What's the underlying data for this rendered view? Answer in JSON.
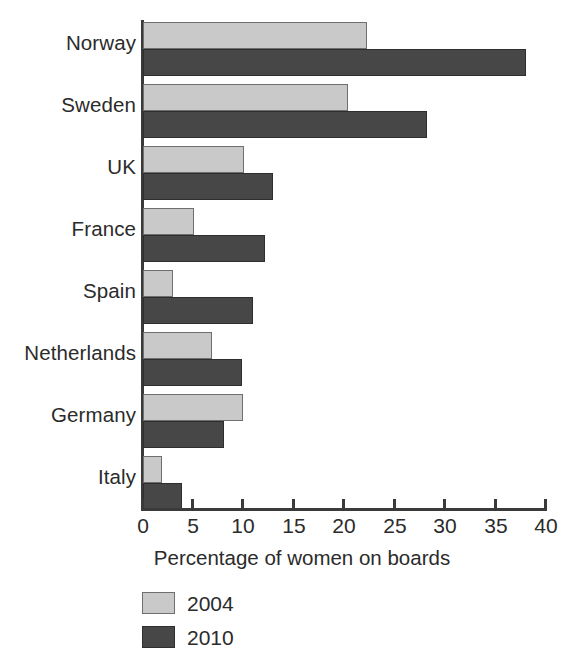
{
  "chart_data": {
    "type": "bar",
    "orientation": "horizontal",
    "title": "",
    "xlabel": "Percentage of women on boards",
    "ylabel": "",
    "xlim": [
      0,
      40
    ],
    "xticks": [
      0,
      5,
      10,
      15,
      20,
      25,
      30,
      35,
      40
    ],
    "xtick_labels": [
      "0",
      "5",
      "10",
      "15",
      "20",
      "25",
      "30",
      "35",
      "40"
    ],
    "grid": false,
    "legend_position": "bottom-left",
    "categories": [
      "Norway",
      "Sweden",
      "UK",
      "France",
      "Spain",
      "Netherlands",
      "Germany",
      "Italy"
    ],
    "series": [
      {
        "name": "2004",
        "color": "#c9c9c9",
        "values": [
          22.3,
          20.4,
          10.1,
          5.1,
          3.0,
          6.9,
          10.0,
          1.9
        ]
      },
      {
        "name": "2010",
        "color": "#474747",
        "values": [
          38.2,
          28.3,
          13.0,
          12.2,
          11.0,
          9.9,
          8.1,
          3.9
        ]
      }
    ]
  },
  "axis": {
    "title": "Percentage of women on boards"
  },
  "legend": {
    "entries": [
      {
        "label": "2004",
        "swatch": "light"
      },
      {
        "label": "2010",
        "swatch": "dark"
      }
    ]
  }
}
